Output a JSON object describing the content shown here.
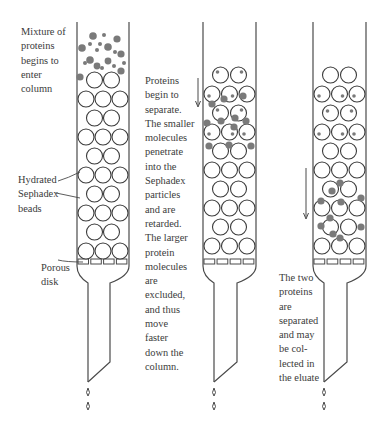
{
  "figure": {
    "type": "gel-filtration-column-diagram",
    "colors": {
      "line": "#4a4a4a",
      "bead_stroke": "#3c3c3c",
      "large_protein": "#7a7a7a",
      "small_protein": "#7a7a7a",
      "background": "#ffffff"
    },
    "stages": [
      {
        "id": "stage-1",
        "description": "Mixture of proteins begins to enter column",
        "labels": {
          "top": "Mixture of\nproteins\nbegins to\nenter\ncolumn",
          "beads": "Hydrated\nSephadex\nbeads",
          "disk": "Porous\ndisk"
        }
      },
      {
        "id": "stage-2",
        "labels": {
          "side": "Proteins\nbegin to\nseparate.\nThe smaller\nmolecules\npenetrate\ninto the\nSephadex\nparticles\nand are\nretarded.\nThe larger\nprotein\nmolecules\nare\nexcluded,\nand thus\nmove\nfaster\ndown the\ncolumn."
        }
      },
      {
        "id": "stage-3",
        "labels": {
          "bottom": "The two\nproteins\nare\nseparated\nand may\nbe col-\nlected in\nthe eluate"
        }
      }
    ]
  }
}
